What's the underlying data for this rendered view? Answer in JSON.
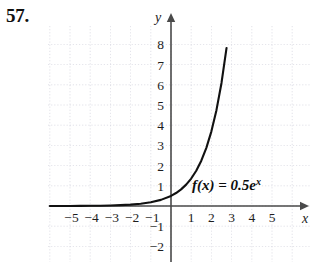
{
  "problem": {
    "number": "57."
  },
  "figure": {
    "name": "exponential-function-graph",
    "function_label_parts": {
      "main": "f(x) = 0.5e",
      "exponent": "x"
    },
    "axis_labels": {
      "x": "x",
      "y": "y"
    }
  },
  "chart_data": {
    "type": "line",
    "title": "",
    "subtitle": "",
    "xlabel": "x",
    "ylabel": "y",
    "annotations": [
      "f(x) = 0.5e^x"
    ],
    "grid": true,
    "legend": "none",
    "xlim": [
      -6.2,
      6.6
    ],
    "ylim": [
      -2.8,
      10.4
    ],
    "xticks": [
      -5,
      -4,
      -3,
      -2,
      -1,
      1,
      2,
      3,
      4,
      5
    ],
    "yticks": [
      -2,
      -1,
      1,
      2,
      3,
      4,
      5,
      6,
      7,
      8
    ],
    "xtick_labels": [
      "−5",
      "−4",
      "−3",
      "−2",
      "−1",
      "1",
      "2",
      "3",
      "4",
      "5"
    ],
    "ytick_labels": [
      "−2",
      "−1",
      "1",
      "2",
      "3",
      "4",
      "5",
      "6",
      "7",
      "8"
    ],
    "series": [
      {
        "name": "f(x) = 0.5e^x",
        "expression": "0.5*exp(x)",
        "x": [
          -6,
          -5.5,
          -5,
          -4.5,
          -4,
          -3.5,
          -3,
          -2.5,
          -2,
          -1.5,
          -1,
          -0.5,
          0,
          0.25,
          0.5,
          0.75,
          1,
          1.25,
          1.5,
          1.75,
          2,
          2.25,
          2.5,
          2.75,
          3,
          3.05
        ],
        "y": [
          0.001,
          0.002,
          0.003,
          0.006,
          0.009,
          0.015,
          0.025,
          0.041,
          0.068,
          0.112,
          0.184,
          0.303,
          0.5,
          0.642,
          0.824,
          1.058,
          1.359,
          1.746,
          2.241,
          2.878,
          3.695,
          4.745,
          6.092,
          7.824,
          10.043,
          10.558
        ]
      }
    ]
  }
}
